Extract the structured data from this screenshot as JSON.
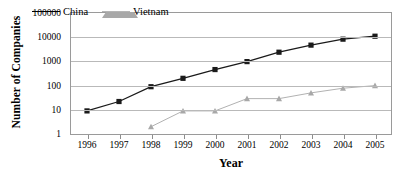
{
  "chart_data": {
    "type": "line",
    "title": "",
    "xlabel": "Year",
    "ylabel": "Number of Companies",
    "x": [
      1996,
      1997,
      1998,
      1999,
      2000,
      2001,
      2002,
      2003,
      2004,
      2005
    ],
    "categories": [
      "1996",
      "1997",
      "1998",
      "1999",
      "2000",
      "2001",
      "2002",
      "2003",
      "2004",
      "2005"
    ],
    "yscale": "log",
    "ylim": [
      1,
      100000
    ],
    "ytick_labels": [
      "1",
      "10",
      "100",
      "1000",
      "10000",
      "100000"
    ],
    "ytick_values": [
      1,
      10,
      100,
      1000,
      10000,
      100000
    ],
    "grid": "horizontal",
    "legend_position": "top-left-inside",
    "series": [
      {
        "name": "China",
        "color": "#1a1a1a",
        "marker": "square",
        "values": [
          9,
          22,
          90,
          200,
          460,
          980,
          2400,
          4700,
          8300,
          11000
        ]
      },
      {
        "name": "Vietnam",
        "color": "#a8a8a8",
        "marker": "triangle",
        "values": [
          null,
          null,
          2,
          9,
          9,
          29,
          29,
          50,
          78,
          100
        ]
      }
    ]
  },
  "axes": {
    "x_title": "Year",
    "y_title": "Number of Companies"
  },
  "legend": {
    "items": [
      {
        "label": "China"
      },
      {
        "label": "Vietnam"
      }
    ]
  },
  "colors": {
    "china": "#1a1a1a",
    "vietnam": "#a8a8a8",
    "gridline": "#b9b9b9",
    "frame": "#9a9a9a",
    "background": "#ffffff"
  }
}
